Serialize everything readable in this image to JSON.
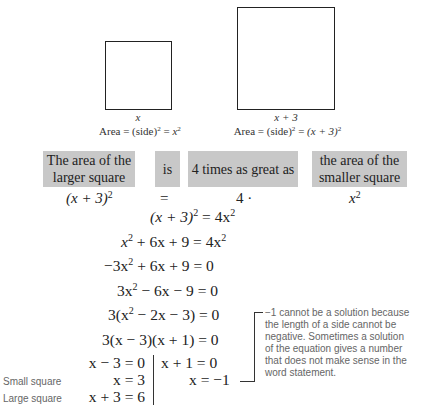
{
  "figure": {
    "small_square": {
      "side_label_var": "x",
      "area_prefix": "Area = (side)",
      "area_exp": "2",
      "area_eq": " = ",
      "area_result_var": "x",
      "area_result_exp": "2"
    },
    "large_square": {
      "side_label": "x + 3",
      "area_prefix": "Area = (side)",
      "area_exp": "2",
      "area_eq": " = ",
      "area_result": "(x + 3)",
      "area_result_exp": "2"
    }
  },
  "translation": {
    "boxes": [
      {
        "line1": "The area of the",
        "line2": "larger square"
      },
      {
        "line1": "is"
      },
      {
        "line1": "4 times as great as"
      },
      {
        "line1": "the area of the",
        "line2": "smaller square"
      }
    ],
    "expressions": [
      {
        "base": "(x + 3)",
        "exp": "2"
      },
      {
        "base": "="
      },
      {
        "base": "4 ·"
      },
      {
        "base": "x",
        "exp": "2"
      }
    ]
  },
  "steps": [
    {
      "lhs": "(x + 3)",
      "lhs_exp": "2",
      "rest": " = 4x",
      "rest_exp": "2"
    },
    {
      "a": "x",
      "a_exp": "2",
      "b": " + 6x + 9 = 4x",
      "b_exp": "2"
    },
    {
      "a": "−3x",
      "a_exp": "2",
      "b": " + 6x + 9 = 0"
    },
    {
      "a": "3x",
      "a_exp": "2",
      "b": " − 6x − 9 = 0"
    },
    {
      "a": "3(x",
      "a_exp": "2",
      "b": " − 2x − 3) = 0"
    },
    {
      "a": "3(x − 3)(x + 1) = 0"
    }
  ],
  "solutions": {
    "left": [
      "x − 3 = 0",
      "x = 3",
      "x + 3 = 6"
    ],
    "right": [
      "x + 1 = 0",
      "x = −1"
    ]
  },
  "side_labels": {
    "small": "Small square",
    "large": "Large square"
  },
  "note": "−1 cannot be a solution because the length of a side cannot be negative. Sometimes a solution of the equation gives a number that does not make sense in the word statement."
}
